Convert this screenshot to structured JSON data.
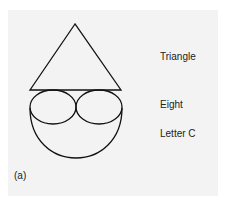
{
  "figure": {
    "panel_label": "(a)",
    "labels": {
      "triangle": "Triangle",
      "eight": "Eight",
      "letter_c": "Letter C"
    },
    "colors": {
      "background": "#f3f3f3",
      "stroke": "#111111",
      "text": "#222222"
    },
    "shapes": [
      {
        "name": "triangle",
        "type": "polygon",
        "points": [
          [
            75,
            24
          ],
          [
            30,
            90
          ],
          [
            121,
            90
          ]
        ]
      },
      {
        "name": "eight-left-loop",
        "type": "ellipse",
        "cx": 53,
        "cy": 107,
        "rx": 23,
        "ry": 17
      },
      {
        "name": "eight-right-loop",
        "type": "ellipse",
        "cx": 99,
        "cy": 107,
        "rx": 23,
        "ry": 17
      },
      {
        "name": "letter-c-arc",
        "type": "arc",
        "from": [
          30,
          108
        ],
        "to": [
          122,
          108
        ],
        "bottom_y": 158
      }
    ]
  }
}
